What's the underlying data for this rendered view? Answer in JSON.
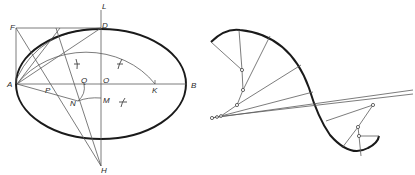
{
  "figure": {
    "left": {
      "title": "Approximate ellipse construction",
      "labels": {
        "L": "L",
        "D": "D",
        "F": "F",
        "A": "A",
        "B": "B",
        "P": "P",
        "Q": "Q",
        "O": "O",
        "K": "K",
        "N": "N",
        "M": "M",
        "H": "H"
      }
    },
    "right": {
      "title": "Reverse spiral curve with circle-arc construction"
    },
    "colors": {
      "ink": "#1a1a1a",
      "construction": "#5a5a5a",
      "background": "#ffffff"
    }
  }
}
